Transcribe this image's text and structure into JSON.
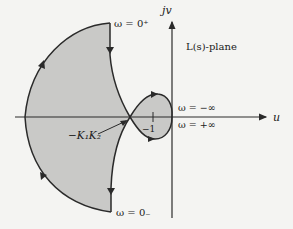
{
  "diagram": {
    "plane_label": "L(s)-plane",
    "axes": {
      "horizontal_label": "u",
      "vertical_label": "jv"
    },
    "annotations": {
      "omega_0_plus": "ω = 0⁺",
      "omega_0_minus": "ω = 0₋",
      "omega_neg_inf": "ω = −∞",
      "omega_pos_inf": "ω = +∞",
      "crossing_point": "−K₁K₂",
      "critical_point": "−1"
    },
    "colors": {
      "background": "#f4f4f2",
      "shaded_region": "#c9c9c7",
      "curve": "#2a2a2a",
      "axis": "#2a2a2a"
    }
  }
}
